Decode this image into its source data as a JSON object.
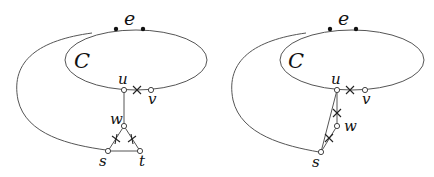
{
  "figure": {
    "panels": [
      {
        "id": "left",
        "labels": {
          "edge": "e",
          "cycle": "C",
          "u": "u",
          "v": "v",
          "w": "w",
          "s": "s",
          "t": "t"
        }
      },
      {
        "id": "right",
        "labels": {
          "edge": "e",
          "cycle": "C",
          "u": "u",
          "v": "v",
          "w": "w",
          "s": "s"
        }
      }
    ],
    "colors": {
      "line": "#555555",
      "text": "#111111",
      "background": "#ffffff"
    }
  }
}
